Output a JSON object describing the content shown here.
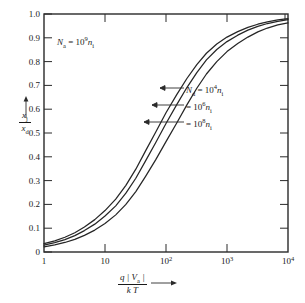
{
  "figure": {
    "background_color": "#ffffff",
    "line_color": "#262626"
  },
  "annotation_na": {
    "symbol": "N",
    "symbol_sub": "a",
    "equals": "=",
    "mantissa": "10",
    "exponent": "9",
    "unit": "n",
    "unit_sub": "i"
  },
  "axis_labels": {
    "y_numerator": "x",
    "y_numerator_sub": "j",
    "y_denominator": "x",
    "y_denominator_sub": "d",
    "x_numerator": "q | V",
    "x_numerator_sub": "a",
    "x_numerator_tail": " |",
    "x_denominator": "k T"
  },
  "curve_labels": [
    {
      "symbol": "N",
      "symbol_sub": "d",
      "equals": "=",
      "mantissa": "10",
      "exponent": "4",
      "unit": "n",
      "unit_sub": "i"
    },
    {
      "symbol": "",
      "symbol_sub": "",
      "equals": "=",
      "mantissa": "10",
      "exponent": "6",
      "unit": "n",
      "unit_sub": "i"
    },
    {
      "symbol": "",
      "symbol_sub": "",
      "equals": "=",
      "mantissa": "10",
      "exponent": "8",
      "unit": "n",
      "unit_sub": "i"
    }
  ],
  "x_tick_labels": [
    {
      "mantissa": "1",
      "exponent": ""
    },
    {
      "mantissa": "10",
      "exponent": ""
    },
    {
      "mantissa": "10",
      "exponent": "2"
    },
    {
      "mantissa": "10",
      "exponent": "3"
    },
    {
      "mantissa": "10",
      "exponent": "4"
    }
  ],
  "y_tick_labels": [
    "0",
    "0.1",
    "0.2",
    "0.3",
    "0.4",
    "0.5",
    "0.6",
    "0.7",
    "0.8",
    "0.9",
    "1.0"
  ],
  "chart_data": {
    "type": "line",
    "title": "",
    "xlabel": "q |V_a| / kT",
    "ylabel": "x_j / x_d",
    "xscale": "log",
    "yscale": "linear",
    "xlim": [
      1,
      10000
    ],
    "ylim": [
      0,
      1.0
    ],
    "grid": false,
    "legend_position": "inline-annotations",
    "annotations": [
      "N_a = 10^9 n_i"
    ],
    "x_ticks": [
      1,
      10,
      100,
      1000,
      10000
    ],
    "y_ticks": [
      0,
      0.1,
      0.2,
      0.3,
      0.4,
      0.5,
      0.6,
      0.7,
      0.8,
      0.9,
      1.0
    ],
    "x": [
      1,
      1.5,
      2.2,
      3.2,
      4.6,
      6.8,
      10,
      15,
      22,
      32,
      46,
      68,
      100,
      150,
      220,
      320,
      460,
      680,
      1000,
      1500,
      2200,
      3200,
      4600,
      6800,
      10000
    ],
    "series": [
      {
        "name": "N_d = 10^4 n_i",
        "values": [
          0.035,
          0.047,
          0.062,
          0.081,
          0.105,
          0.136,
          0.174,
          0.222,
          0.28,
          0.348,
          0.424,
          0.504,
          0.585,
          0.661,
          0.729,
          0.787,
          0.835,
          0.874,
          0.903,
          0.926,
          0.944,
          0.957,
          0.967,
          0.975,
          0.981
        ]
      },
      {
        "name": "N_d = 10^6 n_i",
        "values": [
          0.029,
          0.039,
          0.052,
          0.069,
          0.09,
          0.117,
          0.151,
          0.194,
          0.247,
          0.31,
          0.382,
          0.46,
          0.54,
          0.619,
          0.691,
          0.754,
          0.807,
          0.851,
          0.884,
          0.911,
          0.932,
          0.948,
          0.96,
          0.969,
          0.976
        ]
      },
      {
        "name": "N_d = 10^8 n_i",
        "values": [
          0.022,
          0.03,
          0.04,
          0.053,
          0.07,
          0.092,
          0.12,
          0.156,
          0.2,
          0.254,
          0.317,
          0.388,
          0.464,
          0.542,
          0.618,
          0.688,
          0.748,
          0.8,
          0.842,
          0.876,
          0.903,
          0.925,
          0.941,
          0.954,
          0.963
        ]
      }
    ]
  }
}
